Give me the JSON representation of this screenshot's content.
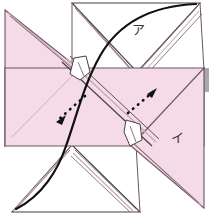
{
  "figure": {
    "name": "origami-pinwheel-fold-diagram",
    "width": 209,
    "height": 217,
    "background_color": "#ffffff"
  },
  "colors": {
    "paper_fill": "#f5dbe7",
    "paper_fill_light": "#f8e6ee",
    "paper_edge": "#6b5560",
    "crease_line": "#b08a9c",
    "outline_dark": "#3a3036",
    "arc_line": "#111111",
    "arrow_dots": "#111111",
    "tab_fill": "#ffffff",
    "scroll_gray": "#a9a6ae"
  },
  "labels": {
    "upper_flap": "ア",
    "lower_flap": "イ"
  },
  "annotations": {
    "arrow_lower_left": {
      "name": "dotted-arrow-lower-left",
      "direction": "lower-left",
      "style": "dotted",
      "dot_count": 7
    },
    "arrow_upper_right": {
      "name": "dotted-arrow-upper-right",
      "direction": "upper-right",
      "style": "dotted",
      "dot_count": 7
    },
    "arc_top": {
      "name": "fold-arc-top",
      "description": "curved solid fold path sweeping from upper-right corner down through center"
    },
    "arc_bottom": {
      "name": "fold-arc-bottom",
      "description": "curved solid fold path sweeping from center down to lower-left corner"
    }
  },
  "shapes": {
    "center_band": {
      "name": "center-paper-band",
      "description": "Large pink parallelogram band crossing the middle of the figure"
    },
    "left_triangle": {
      "name": "left-paper-triangle",
      "description": "Pink triangular flap at the upper-left pointing down-right"
    },
    "right_triangle": {
      "name": "right-paper-triangle",
      "description": "Pink triangular flap at the lower-right pointing up-left"
    },
    "top_flap": {
      "name": "top-white-flap",
      "description": "White V-shaped layered flap at the top labelled A"
    },
    "bottom_flap": {
      "name": "bottom-white-flap",
      "description": "White layered triangular flap at the bottom"
    },
    "tab_upper": {
      "name": "paper-tab-upper",
      "description": "Small white folded tab near the upper-centre"
    },
    "tab_lower": {
      "name": "paper-tab-lower",
      "description": "Small white folded tab near the lower-centre"
    },
    "scrollbar_sliver": {
      "name": "scrollbar-sliver",
      "description": "Thin grey vertical sliver at the right edge"
    }
  }
}
